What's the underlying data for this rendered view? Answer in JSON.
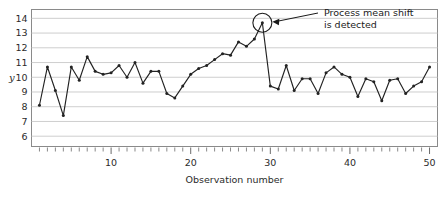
{
  "chart_data": {
    "type": "line",
    "title": "",
    "xlabel": "Observation number",
    "ylabel": "y",
    "xlim": [
      0,
      51
    ],
    "ylim": [
      5.3,
      14.6
    ],
    "grid": true,
    "legend": null,
    "x_ticks_major": [
      10,
      20,
      30,
      40,
      50
    ],
    "x_tick_labels": [
      "10",
      "20",
      "30",
      "40",
      "50"
    ],
    "y_ticks": [
      6,
      7,
      8,
      9,
      10,
      11,
      12,
      13,
      14
    ],
    "y_tick_labels": [
      "6",
      "7",
      "8",
      "9",
      "10",
      "11",
      "12",
      "13",
      "14"
    ],
    "x_minor_tick_step": 1,
    "marker": "filled-circle",
    "line_color": "#222222",
    "grid_color": "#c8c8c8",
    "x": [
      1,
      2,
      3,
      4,
      5,
      6,
      7,
      8,
      9,
      10,
      11,
      12,
      13,
      14,
      15,
      16,
      17,
      18,
      19,
      20,
      21,
      22,
      23,
      24,
      25,
      26,
      27,
      28,
      29,
      30,
      31,
      32,
      33,
      34,
      35,
      36,
      37,
      38,
      39,
      40,
      41,
      42,
      43,
      44,
      45,
      46,
      47,
      48,
      49,
      50
    ],
    "values": [
      8.1,
      10.7,
      9.1,
      7.4,
      10.7,
      9.8,
      11.4,
      10.4,
      10.2,
      10.3,
      10.8,
      10.0,
      11.0,
      9.6,
      10.4,
      10.4,
      8.9,
      8.6,
      9.4,
      10.2,
      10.6,
      10.8,
      11.2,
      11.6,
      11.5,
      12.4,
      12.1,
      12.6,
      13.7,
      9.4,
      9.2,
      10.8,
      9.1,
      9.9,
      9.9,
      8.9,
      10.3,
      10.7,
      10.2,
      10.0,
      8.7,
      9.9,
      9.7,
      8.4,
      9.8,
      9.9,
      8.9,
      9.4,
      9.7,
      10.7
    ],
    "annotations": [
      {
        "name": "process-mean-shift",
        "text_line1": "Process mean shift",
        "text_line2": "is detected",
        "points_to_x": 29,
        "points_to_y": 13.7,
        "marker_shape": "circle-outline",
        "arrow": true
      }
    ]
  }
}
